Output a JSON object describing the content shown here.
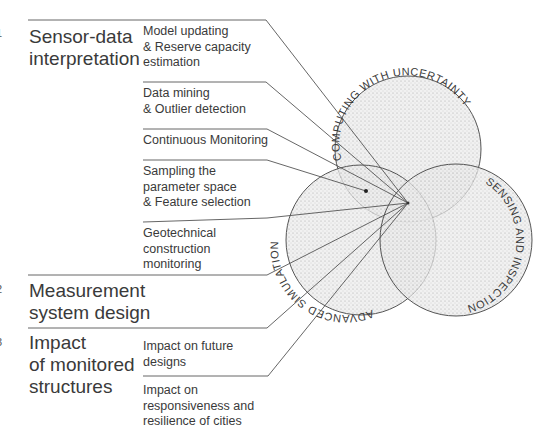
{
  "diagram": {
    "sections": [
      {
        "number": "1",
        "title": "Sensor-data\ninterpretation",
        "items": [
          "Model updating\n& Reserve capacity\nestimation",
          "Data mining\n& Outlier detection",
          "Continuous Monitoring",
          "Sampling the\nparameter space\n& Feature selection",
          "Geotechnical\nconstruction\nmonitoring"
        ]
      },
      {
        "number": "2",
        "title": "Measurement\nsystem design",
        "items": []
      },
      {
        "number": "3",
        "title": "Impact\nof monitored\nstructures",
        "items": [
          "Impact on future\ndesigns",
          "Impact on\nresponsiveness and\nresilience of cities"
        ]
      }
    ],
    "circles": [
      {
        "label": "COMPUTING WITH UNCERTAINTY"
      },
      {
        "label": "ADVANCED SIMULATION"
      },
      {
        "label": "SENSING AND INSPECTION"
      }
    ],
    "colors": {
      "line": "#555555",
      "stipple": "#9a9a9a",
      "text": "#3a3a3a"
    }
  }
}
